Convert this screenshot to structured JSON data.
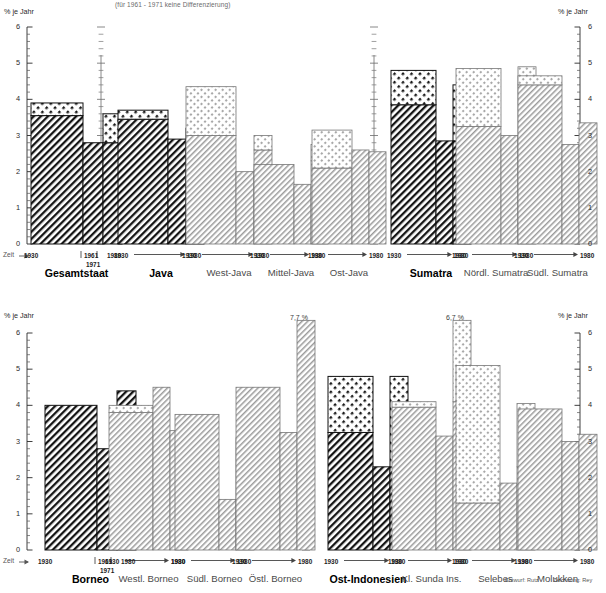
{
  "header": {
    "note": "(für 1961 - 1971 keine Differenzierung)"
  },
  "axis": {
    "unit_label": "% je Jahr",
    "time_label": "Zeit",
    "ticks": [
      "0",
      "1",
      "2",
      "3",
      "4",
      "5",
      "6"
    ],
    "ymin": 0,
    "ymax": 6,
    "minor_per_major": 5
  },
  "period_labels": {
    "start": "1930",
    "mid": "1961",
    "mid2": "1971",
    "end": "1980",
    "arrow": "→"
  },
  "credit": {
    "design": "Entwurf: Rutz",
    "drawing": "Zeichnung: Rey"
  },
  "colors": {
    "ink": "#1a1a1a",
    "dark_hatch": "#111111",
    "mid_hatch": "#555555",
    "light_hatch": "#8a8a8a",
    "dot_fill": "#cfcfcf",
    "background": "#ffffff"
  },
  "chart_data": {
    "type": "bar",
    "title": "",
    "subtitle": "(für 1961 - 1971 keine Differenzierung)",
    "xlabel": "Zeit",
    "ylabel": "% je Jahr",
    "ylim": [
      0,
      6
    ],
    "grid": false,
    "legend": "none",
    "series_names": [
      "1930-1961",
      "1961-1971",
      "1971-1980"
    ],
    "note": "Each group shows three bars: a wide left bar (1930-1961), a narrow middle bar (1961-1971) and a narrow right bar (1971-1980). Where a bar is split, the lower segment is hatched and the upper segment is a lighter dotted overlay.",
    "rows": [
      {
        "row": 1,
        "groups": [
          {
            "name": "Gesamtstaat",
            "emphasis": "major",
            "style": "dark",
            "period_style": "ticked",
            "bars": [
              {
                "period": "1930-1961",
                "total": 3.9,
                "base": 3.55
              },
              {
                "period": "1961-1971",
                "total": 2.8,
                "base": 2.8
              },
              {
                "period": "1971-1980",
                "total": 3.6,
                "base": 2.8
              }
            ]
          },
          {
            "name": "Java",
            "emphasis": "major",
            "style": "dark",
            "period_style": "arrow",
            "bars": [
              {
                "period": "1930-1961",
                "total": 3.7,
                "base": 3.45
              },
              {
                "period": "1961-1971",
                "total": 2.9,
                "base": 2.9
              },
              {
                "period": "1971-1980",
                "total": 3.2,
                "base": 2.9
              }
            ]
          },
          {
            "name": "West-Java",
            "emphasis": "minor",
            "style": "light",
            "period_style": "arrow",
            "bars": [
              {
                "period": "1930-1961",
                "total": 4.35,
                "base": 3.0
              },
              {
                "period": "1961-1971",
                "total": 2.0,
                "base": 2.0
              },
              {
                "period": "1971-1980",
                "total": 3.0,
                "base": 2.6
              }
            ]
          },
          {
            "name": "Mittel-Java",
            "emphasis": "minor",
            "style": "light",
            "period_style": "arrow",
            "bars": [
              {
                "period": "1930-1961",
                "total": 2.2,
                "base": 2.2
              },
              {
                "period": "1961-1971",
                "total": 1.65,
                "base": 1.65
              },
              {
                "period": "1971-1980",
                "total": 2.75,
                "base": 2.3
              }
            ]
          },
          {
            "name": "Ost-Java",
            "emphasis": "minor",
            "style": "light",
            "period_style": "arrow",
            "bars": [
              {
                "period": "1930-1961",
                "total": 3.15,
                "base": 2.1
              },
              {
                "period": "1961-1971",
                "total": 2.6,
                "base": 2.6
              },
              {
                "period": "1971-1980",
                "total": 2.55,
                "base": 2.55
              }
            ]
          },
          {
            "name": "Sumatra",
            "emphasis": "major",
            "style": "dark",
            "period_style": "arrow",
            "bars": [
              {
                "period": "1930-1961",
                "total": 4.8,
                "base": 3.85
              },
              {
                "period": "1961-1971",
                "total": 2.85,
                "base": 2.85
              },
              {
                "period": "1971-1980",
                "total": 4.4,
                "base": 2.85
              }
            ]
          },
          {
            "name": "Nördl. Sumatra",
            "emphasis": "minor",
            "style": "light",
            "period_style": "arrow",
            "bars": [
              {
                "period": "1930-1961",
                "total": 4.85,
                "base": 3.25
              },
              {
                "period": "1961-1971",
                "total": 3.0,
                "base": 3.0
              },
              {
                "period": "1971-1980",
                "total": 4.9,
                "base": 2.4
              }
            ]
          },
          {
            "name": "Südl. Sumatra",
            "emphasis": "minor",
            "style": "light",
            "period_style": "arrow",
            "bars": [
              {
                "period": "1930-1961",
                "total": 4.65,
                "base": 4.4
              },
              {
                "period": "1961-1971",
                "total": 2.75,
                "base": 2.75
              },
              {
                "period": "1971-1980",
                "total": 3.35,
                "base": 3.35
              }
            ]
          }
        ]
      },
      {
        "row": 2,
        "groups": [
          {
            "name": "Borneo",
            "emphasis": "major",
            "style": "dark",
            "period_style": "ticked",
            "bars": [
              {
                "period": "1930-1961",
                "total": 4.0,
                "base": 4.0
              },
              {
                "period": "1961-1971",
                "total": 2.8,
                "base": 2.8
              },
              {
                "period": "1971-1980",
                "total": 4.4,
                "base": 4.4
              }
            ]
          },
          {
            "name": "Westl. Borneo",
            "emphasis": "minor",
            "style": "light",
            "period_style": "arrow",
            "bars": [
              {
                "period": "1930-1961",
                "total": 4.0,
                "base": 3.8
              },
              {
                "period": "1961-1971",
                "total": 4.5,
                "base": 4.5
              },
              {
                "period": "1971-1980",
                "total": 3.3,
                "base": 3.3
              }
            ]
          },
          {
            "name": "Südl. Borneo",
            "emphasis": "minor",
            "style": "light",
            "period_style": "arrow",
            "bars": [
              {
                "period": "1930-1961",
                "total": 3.75,
                "base": 3.75
              },
              {
                "period": "1961-1971",
                "total": 1.4,
                "base": 1.4
              },
              {
                "period": "1971-1980",
                "total": 3.1,
                "base": 3.1
              }
            ]
          },
          {
            "name": "Östl. Borneo",
            "emphasis": "minor",
            "style": "light",
            "period_style": "arrow",
            "annotation": "7,7 %",
            "bars": [
              {
                "period": "1930-1961",
                "total": 4.5,
                "base": 4.5
              },
              {
                "period": "1961-1971",
                "total": 3.25,
                "base": 3.25
              },
              {
                "period": "1971-1980",
                "total": 7.7,
                "base": 7.7,
                "clipped": true
              }
            ]
          },
          {
            "name": "Ost-Indonesien",
            "emphasis": "major",
            "style": "dark",
            "period_style": "arrow",
            "bars": [
              {
                "period": "1930-1961",
                "total": 4.8,
                "base": 3.25
              },
              {
                "period": "1961-1971",
                "total": 2.3,
                "base": 2.3
              },
              {
                "period": "1971-1980",
                "total": 4.8,
                "base": 2.3
              }
            ]
          },
          {
            "name": "Kl. Sunda Ins.",
            "emphasis": "minor",
            "style": "light",
            "period_style": "arrow",
            "annotation": "6,7 %",
            "bars": [
              {
                "period": "1930-1961",
                "total": 4.1,
                "base": 3.95
              },
              {
                "period": "1961-1971",
                "total": 3.15,
                "base": 3.15
              },
              {
                "period": "1971-1980",
                "total": 6.7,
                "base": 4.1,
                "clipped": true
              }
            ]
          },
          {
            "name": "Selebes",
            "emphasis": "minor",
            "style": "light",
            "period_style": "arrow",
            "bars": [
              {
                "period": "1930-1961",
                "total": 5.1,
                "base": 1.3
              },
              {
                "period": "1961-1971",
                "total": 1.85,
                "base": 1.85
              },
              {
                "period": "1971-1980",
                "total": 4.05,
                "base": 2.3
              }
            ]
          },
          {
            "name": "Molukken",
            "emphasis": "minor",
            "style": "light",
            "period_style": "arrow",
            "bars": [
              {
                "period": "1930-1961",
                "total": 3.9,
                "base": 3.9
              },
              {
                "period": "1961-1971",
                "total": 3.0,
                "base": 3.0
              },
              {
                "period": "1971-1980",
                "total": 3.2,
                "base": 3.2
              }
            ]
          }
        ]
      }
    ]
  }
}
